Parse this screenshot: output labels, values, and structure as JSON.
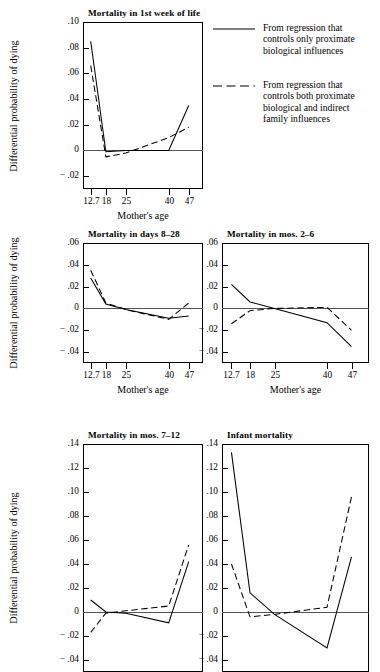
{
  "figure": {
    "y_axis_title": "Differential probability of dying",
    "x_axis_title": "Mother's age",
    "x_tick_labels": [
      "12.7",
      "18",
      "25",
      "40",
      "47"
    ]
  },
  "legend": {
    "entries": [
      {
        "style": "solid",
        "label": "From regression that\ncontrols only proximate\nbiological influences"
      },
      {
        "style": "dashed",
        "label": "From regression that\ncontrols both proximate\nbiological and indirect\nfamily influences"
      }
    ]
  },
  "chart_data": [
    {
      "type": "line",
      "title": "Mortality in 1st week of life",
      "xlabel": "Mother's age",
      "ylabel": "Differential probability of dying",
      "x": [
        12.7,
        18,
        25,
        40,
        47
      ],
      "xlim": [
        10.0,
        52.0
      ],
      "ylim": [
        -0.03,
        0.1
      ],
      "yticks": [
        -0.02,
        0,
        0.02,
        0.04,
        0.06,
        0.08,
        0.1
      ],
      "ytick_labels": [
        "− .02",
        "0",
        ".02",
        ".04",
        ".06",
        ".08",
        ".10"
      ],
      "grid": false,
      "zero_line": true,
      "series": [
        {
          "name": "From regression that controls only proximate biological influences",
          "style": "solid",
          "values": [
            0.085,
            -0.001,
            0.0,
            0.0,
            0.035
          ]
        },
        {
          "name": "From regression that controls both proximate biological and indirect family influences",
          "style": "dashed",
          "values": [
            0.066,
            -0.005,
            -0.002,
            0.01,
            0.018
          ]
        }
      ]
    },
    {
      "type": "line",
      "title": "Mortality in days 8–28",
      "xlabel": "Mother's age",
      "ylabel": "Differential probability of dying",
      "x": [
        12.7,
        18,
        25,
        40,
        47
      ],
      "xlim": [
        10.0,
        52.0
      ],
      "ylim": [
        -0.05,
        0.06
      ],
      "yticks": [
        -0.04,
        -0.02,
        0,
        0.02,
        0.04,
        0.06
      ],
      "ytick_labels": [
        "− .04",
        "− .02",
        "0",
        ".02",
        ".04",
        ".06"
      ],
      "grid": false,
      "zero_line": true,
      "series": [
        {
          "name": "From regression that controls only proximate biological influences",
          "style": "solid",
          "values": [
            0.028,
            0.004,
            -0.001,
            -0.009,
            -0.007
          ]
        },
        {
          "name": "From regression that controls both proximate biological and indirect family influences",
          "style": "dashed",
          "values": [
            0.035,
            0.005,
            -0.001,
            -0.01,
            0.005
          ]
        }
      ]
    },
    {
      "type": "line",
      "title": "Mortality in mos. 2–6",
      "xlabel": "Mother's age",
      "ylabel": "Differential probability of dying",
      "x": [
        12.7,
        18,
        25,
        40,
        47
      ],
      "xlim": [
        10.0,
        52.0
      ],
      "ylim": [
        -0.05,
        0.06
      ],
      "yticks": [
        -0.04,
        -0.02,
        0,
        0.02,
        0.04,
        0.06
      ],
      "ytick_labels": [
        "− .04",
        "− .02",
        "0",
        ".02",
        ".04",
        ".06"
      ],
      "grid": false,
      "zero_line": true,
      "series": [
        {
          "name": "From regression that controls only proximate biological influences",
          "style": "solid",
          "values": [
            0.022,
            0.006,
            0.0,
            -0.013,
            -0.035
          ]
        },
        {
          "name": "From regression that controls both proximate biological and indirect family influences",
          "style": "dashed",
          "values": [
            -0.014,
            -0.002,
            0.0,
            0.001,
            -0.02
          ]
        }
      ]
    },
    {
      "type": "line",
      "title": "Mortality in mos. 7–12",
      "xlabel": "Mother's age",
      "ylabel": "Differential probability of dying",
      "x": [
        12.7,
        18,
        25,
        40,
        47
      ],
      "xlim": [
        10.0,
        52.0
      ],
      "ylim": [
        -0.05,
        0.14
      ],
      "yticks": [
        -0.04,
        -0.02,
        0,
        0.02,
        0.04,
        0.06,
        0.08,
        0.1,
        0.12,
        0.14
      ],
      "ytick_labels": [
        "− .04",
        "− .02",
        "0",
        ".02",
        ".04",
        ".06",
        ".08",
        ".10",
        ".12",
        ".14"
      ],
      "grid": false,
      "zero_line": true,
      "series": [
        {
          "name": "From regression that controls only proximate biological influences",
          "style": "solid",
          "values": [
            0.01,
            0.0,
            -0.001,
            -0.009,
            0.042
          ]
        },
        {
          "name": "From regression that controls both proximate biological and indirect family influences",
          "style": "dashed",
          "values": [
            -0.017,
            -0.001,
            0.001,
            0.005,
            0.056
          ]
        }
      ]
    },
    {
      "type": "line",
      "title": "Infant mortality",
      "xlabel": "Mother's age",
      "ylabel": "Differential probability of dying",
      "x": [
        12.7,
        18,
        25,
        40,
        47
      ],
      "xlim": [
        10.0,
        52.0
      ],
      "ylim": [
        -0.05,
        0.14
      ],
      "yticks": [
        -0.04,
        -0.02,
        0,
        0.02,
        0.04,
        0.06,
        0.08,
        0.1,
        0.12,
        0.14
      ],
      "ytick_labels": [
        "− .04",
        "− .02",
        "0",
        ".02",
        ".04",
        ".06",
        ".08",
        ".10",
        ".12",
        ".14"
      ],
      "grid": false,
      "zero_line": true,
      "series": [
        {
          "name": "From regression that controls only proximate biological influences",
          "style": "solid",
          "values": [
            0.133,
            0.016,
            -0.002,
            -0.03,
            0.046
          ]
        },
        {
          "name": "From regression that controls both proximate biological and indirect family influences",
          "style": "dashed",
          "values": [
            0.04,
            -0.004,
            -0.002,
            0.004,
            0.096
          ]
        }
      ]
    }
  ]
}
